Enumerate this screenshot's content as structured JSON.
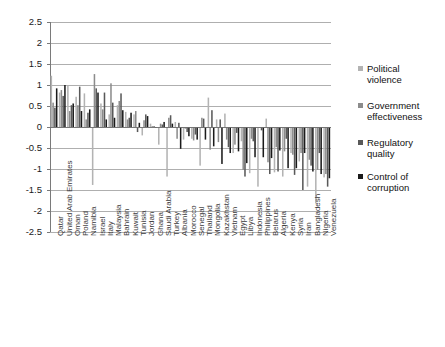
{
  "chart_data": {
    "type": "bar",
    "title": "",
    "xlabel": "",
    "ylabel": "",
    "ylim": [
      -2.5,
      2.5
    ],
    "ytick_labels": [
      "2.5",
      "2",
      "1.5",
      "1",
      "0.5",
      "0",
      "-0.5",
      "-1",
      "-1.5",
      "-2",
      "-2.5"
    ],
    "ytick_values": [
      2.5,
      2,
      1.5,
      1,
      0.5,
      0,
      -0.5,
      -1,
      -1.5,
      -2,
      -2.5
    ],
    "grid": true,
    "legend_position": "right",
    "categories": [
      "Qatar",
      "United Arab Emirates",
      "Oman",
      "Poland",
      "Namibia",
      "Israel",
      "Italy",
      "Malaysia",
      "Bahrain",
      "Kuwait",
      "Tunisia",
      "Jordan",
      "Ghana",
      "Saudi Arabia",
      "Turkey",
      "Albania",
      "Morocco",
      "Senegal",
      "Thailand",
      "Mongolia",
      "Kazakhstan",
      "Vietnam",
      "Egypt",
      "Libya",
      "Indonesia",
      "Philippines",
      "Belarus",
      "Algeria",
      "Kenya",
      "Syria",
      "Iran",
      "Bangladesh",
      "Nigeria",
      "Venezuela"
    ],
    "series": [
      {
        "name": "Political violence",
        "color": "#b3b3b3",
        "values": [
          1.22,
          0.82,
          0.98,
          0.72,
          0.8,
          -1.38,
          0.56,
          0.3,
          0.52,
          0.36,
          0.3,
          -0.2,
          0.08,
          -0.42,
          -1.18,
          0.12,
          -0.3,
          -0.28,
          -0.92,
          0.7,
          0.18,
          0.32,
          -0.62,
          -0.34,
          -1.1,
          -1.42,
          0.2,
          -1.08,
          -1.18,
          -0.62,
          -0.82,
          -1.42,
          -1.82,
          -1.2
        ]
      },
      {
        "name": "Government effectiveness",
        "color": "#8c8c8c",
        "values": [
          0.58,
          0.88,
          0.38,
          0.52,
          0.18,
          1.26,
          0.42,
          1.04,
          0.62,
          0.18,
          0.38,
          0.16,
          0.02,
          0.08,
          0.22,
          -0.28,
          -0.04,
          -0.32,
          0.22,
          -0.54,
          -0.36,
          -0.3,
          -0.42,
          -1.02,
          -0.28,
          -0.02,
          -0.84,
          -0.48,
          -0.58,
          -0.66,
          -0.62,
          -0.78,
          -1.02,
          -1.12
        ]
      },
      {
        "name": "Regulatory quality",
        "color": "#595959",
        "values": [
          0.46,
          0.74,
          0.52,
          0.96,
          0.34,
          0.92,
          0.82,
          0.58,
          0.8,
          0.22,
          -0.12,
          0.3,
          0.02,
          0.06,
          0.28,
          0.1,
          -0.12,
          -0.18,
          0.2,
          0.4,
          0.18,
          -0.48,
          -0.14,
          -1.18,
          -0.34,
          -0.08,
          -1.12,
          -1.06,
          -0.28,
          -1.14,
          -1.5,
          -0.92,
          -0.62,
          -1.42
        ]
      },
      {
        "name": "Control of corruption",
        "color": "#1a1a1a",
        "values": [
          0.92,
          1.0,
          0.56,
          0.38,
          0.42,
          0.82,
          0.18,
          0.22,
          0.4,
          0.34,
          0.1,
          0.26,
          -0.02,
          0.12,
          0.08,
          -0.52,
          -0.22,
          -0.3,
          -0.3,
          -0.46,
          -0.88,
          -0.62,
          -0.58,
          -0.86,
          -0.72,
          -0.72,
          -0.74,
          -0.56,
          -0.98,
          -0.98,
          -0.62,
          -1.06,
          -1.12,
          -1.22
        ]
      }
    ]
  },
  "legend": {
    "items": [
      {
        "label": "Political violence"
      },
      {
        "label": "Government effectiveness"
      },
      {
        "label": "Regulatory quality"
      },
      {
        "label": "Control of corruption"
      }
    ]
  }
}
